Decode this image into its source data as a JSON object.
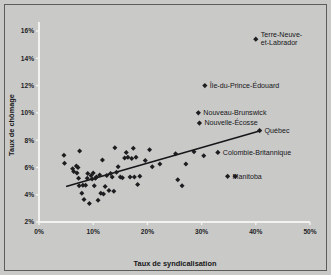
{
  "chart_data": {
    "type": "scatter",
    "title": "",
    "xlabel": "Taux de syndicalisation",
    "ylabel": "Taux de chômage",
    "xlim": [
      0,
      50
    ],
    "ylim": [
      2,
      16
    ],
    "xticks": [
      "0%",
      "10%",
      "20%",
      "30%",
      "40%",
      "50%"
    ],
    "xtick_values": [
      0,
      10,
      20,
      30,
      40,
      50
    ],
    "yticks": [
      "2%",
      "4%",
      "6%",
      "8%",
      "10%",
      "12%",
      "14%",
      "16%"
    ],
    "ytick_values": [
      2,
      4,
      6,
      8,
      10,
      12,
      14,
      16
    ],
    "grid": false,
    "legend": "none",
    "trendline": {
      "x": [
        5.0,
        41.0
      ],
      "y": [
        4.6,
        8.7
      ]
    },
    "points": [
      [
        4.6,
        6.9
      ],
      [
        4.7,
        6.3
      ],
      [
        6.2,
        5.9
      ],
      [
        6.4,
        5.7
      ],
      [
        6.9,
        6.1
      ],
      [
        7.0,
        5.6
      ],
      [
        7.2,
        6.0
      ],
      [
        7.3,
        5.2
      ],
      [
        7.4,
        4.65
      ],
      [
        7.5,
        7.2
      ],
      [
        7.9,
        4.1
      ],
      [
        8.1,
        4.7
      ],
      [
        8.3,
        3.65
      ],
      [
        8.6,
        4.7
      ],
      [
        8.9,
        5.2
      ],
      [
        9.0,
        5.55
      ],
      [
        9.3,
        3.35
      ],
      [
        9.6,
        5.4
      ],
      [
        9.8,
        5.15
      ],
      [
        10.0,
        5.6
      ],
      [
        10.2,
        4.65
      ],
      [
        10.4,
        5.2
      ],
      [
        10.6,
        5.3
      ],
      [
        10.9,
        3.6
      ],
      [
        11.2,
        5.45
      ],
      [
        11.4,
        4.1
      ],
      [
        11.7,
        6.55
      ],
      [
        11.9,
        4.05
      ],
      [
        12.2,
        4.6
      ],
      [
        12.5,
        5.4
      ],
      [
        12.9,
        4.3
      ],
      [
        13.2,
        5.55
      ],
      [
        13.5,
        5.3
      ],
      [
        13.8,
        4.25
      ],
      [
        14.0,
        7.45
      ],
      [
        14.3,
        5.65
      ],
      [
        14.6,
        6.05
      ],
      [
        15.0,
        5.3
      ],
      [
        15.4,
        5.25
      ],
      [
        15.8,
        6.7
      ],
      [
        16.1,
        7.1
      ],
      [
        16.4,
        6.75
      ],
      [
        16.8,
        5.3
      ],
      [
        17.1,
        6.65
      ],
      [
        17.4,
        7.4
      ],
      [
        17.6,
        5.3
      ],
      [
        17.9,
        6.75
      ],
      [
        18.2,
        4.75
      ],
      [
        18.6,
        5.35
      ],
      [
        19.6,
        6.5
      ],
      [
        20.4,
        7.3
      ],
      [
        20.9,
        6.05
      ],
      [
        22.3,
        6.25
      ],
      [
        25.2,
        7.0
      ],
      [
        25.6,
        5.1
      ],
      [
        26.4,
        4.65
      ],
      [
        27.1,
        6.25
      ],
      [
        28.6,
        7.15
      ],
      [
        30.4,
        6.85
      ]
    ],
    "labeled_points": [
      {
        "label": "Terre-Neuve-et-Labrador",
        "x": 40.0,
        "y": 15.4,
        "label_lines": [
          "Terre-Neuve-",
          "et-Labrador"
        ]
      },
      {
        "label": "Île-du-Prince-Édouard",
        "x": 30.6,
        "y": 12.0,
        "label_lines": [
          "Île-du-Prince-Édouard"
        ]
      },
      {
        "label": "Nouveau-Brunswick",
        "x": 29.4,
        "y": 10.0,
        "label_lines": [
          "Nouveau-Brunswick"
        ]
      },
      {
        "label": "Nouvelle-Écosse",
        "x": 29.6,
        "y": 9.25,
        "label_lines": [
          "Nouvelle-Écosse"
        ]
      },
      {
        "label": "Québec",
        "x": 40.7,
        "y": 8.7,
        "label_lines": [
          "Québec"
        ]
      },
      {
        "label": "Colombie-Britannique",
        "x": 33.0,
        "y": 7.1,
        "label_lines": [
          "Colombie-Britannique"
        ]
      },
      {
        "label": "Manitoba",
        "x": 34.8,
        "y": 5.35,
        "label_lines": [
          "Manitoba"
        ]
      },
      {
        "label": "Manitoba-b",
        "x": 36.2,
        "y": 5.35,
        "label_lines": []
      }
    ]
  },
  "colors": {
    "background": "#c9c9c7",
    "axis": "#f2f2f0",
    "marker": "#1d1d20",
    "trendline": "#16161a",
    "frame": "#5c5c5a"
  }
}
